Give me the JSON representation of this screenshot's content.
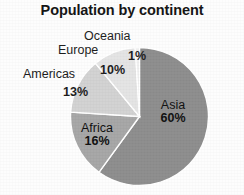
{
  "chart_data": {
    "type": "pie",
    "title": "Population by continent",
    "xlabel": "",
    "ylabel": "",
    "categories": [
      "Asia",
      "Africa",
      "Americas",
      "Europe",
      "Oceania"
    ],
    "values": [
      60,
      16,
      13,
      10,
      1
    ],
    "value_labels": [
      "60%",
      "16%",
      "13%",
      "10%",
      "1%"
    ],
    "unit": "%",
    "legend": "none",
    "grid": false,
    "start_angle_deg": 0,
    "direction": "clockwise",
    "slices": [
      {
        "name": "Asia",
        "value": 60,
        "label": "60%",
        "color": "#8d8d8d",
        "label_placement": "inside"
      },
      {
        "name": "Africa",
        "value": 16,
        "label": "16%",
        "color": "#a6a6a6",
        "label_placement": "inside"
      },
      {
        "name": "Americas",
        "value": 13,
        "label": "13%",
        "color": "#d2d2d2",
        "label_placement": "outside"
      },
      {
        "name": "Europe",
        "value": 10,
        "label": "10%",
        "color": "#e4e4e4",
        "label_placement": "outside"
      },
      {
        "name": "Oceania",
        "value": 1,
        "label": "1%",
        "color": "#efefef",
        "label_placement": "outside"
      }
    ]
  },
  "colors": {
    "background": "#fdfdfd",
    "title_text": "#131313",
    "label_text": "#1b1b1b",
    "slice_separator": "#ffffff",
    "asia": "#8d8d8d",
    "africa": "#a6a6a6",
    "americas": "#d2d2d2",
    "europe": "#e4e4e4",
    "oceania": "#efefef"
  },
  "labels": {
    "oceania_name": "Oceania",
    "oceania_value": "1%",
    "europe_name": "Europe",
    "europe_value": "10%",
    "americas_name": "Americas",
    "americas_value": "13%",
    "asia_name": "Asia",
    "asia_value": "60%",
    "africa_name": "Africa",
    "africa_value": "16%"
  }
}
